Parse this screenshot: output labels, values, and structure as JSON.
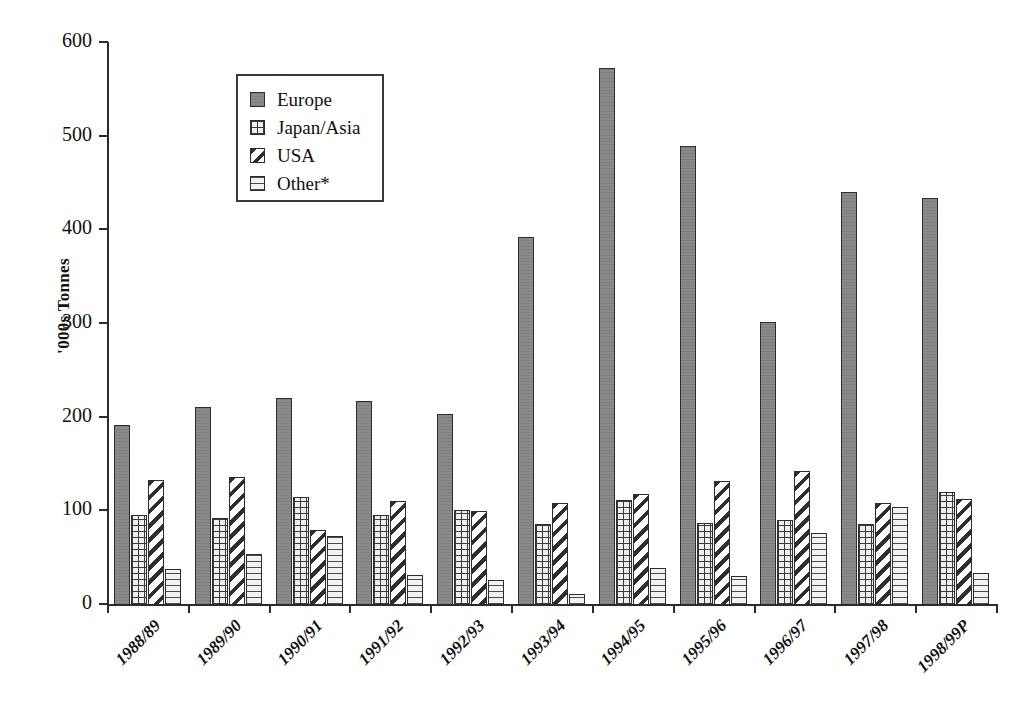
{
  "chart_data": {
    "type": "bar",
    "title": "",
    "subtitle": "",
    "xlabel": "",
    "ylabel": "'000s Tonnes",
    "ylim": [
      0,
      600
    ],
    "ytick_values": [
      0,
      100,
      200,
      300,
      400,
      500,
      600
    ],
    "ytick_labels": [
      "0",
      "100",
      "200",
      "300",
      "400",
      "500",
      "600"
    ],
    "grid": false,
    "legend_position": "upper-left-inside",
    "categories": [
      "1988/89",
      "1989/90",
      "1990/91",
      "1991/92",
      "1992/93",
      "1993/94",
      "1994/95",
      "1995/96",
      "1996/97",
      "1997/98",
      "1998/99P"
    ],
    "series": [
      {
        "name": "Europe",
        "pattern": "solid-grey",
        "color": "#8a8a8a",
        "values": [
          192,
          211,
          221,
          218,
          204,
          393,
          573,
          490,
          302,
          441,
          435
        ]
      },
      {
        "name": "Japan/Asia",
        "pattern": "cross-grid",
        "color": "#efefef",
        "values": [
          96,
          93,
          115,
          96,
          101,
          86,
          112,
          88,
          91,
          87,
          121
        ]
      },
      {
        "name": "USA",
        "pattern": "diagonal-hatch",
        "color": "#ffffff",
        "values": [
          133,
          137,
          80,
          111,
          100,
          109,
          118,
          132,
          143,
          109,
          113
        ]
      },
      {
        "name": "Other*",
        "pattern": "horizontal-lines",
        "color": "#f2f2f2",
        "values": [
          38,
          54,
          74,
          32,
          27,
          12,
          39,
          31,
          77,
          105,
          34
        ]
      }
    ],
    "annotations": []
  },
  "legend": {
    "items": [
      {
        "label": "Europe"
      },
      {
        "label": "Japan/Asia"
      },
      {
        "label": "USA"
      },
      {
        "label": "Other*"
      }
    ]
  }
}
